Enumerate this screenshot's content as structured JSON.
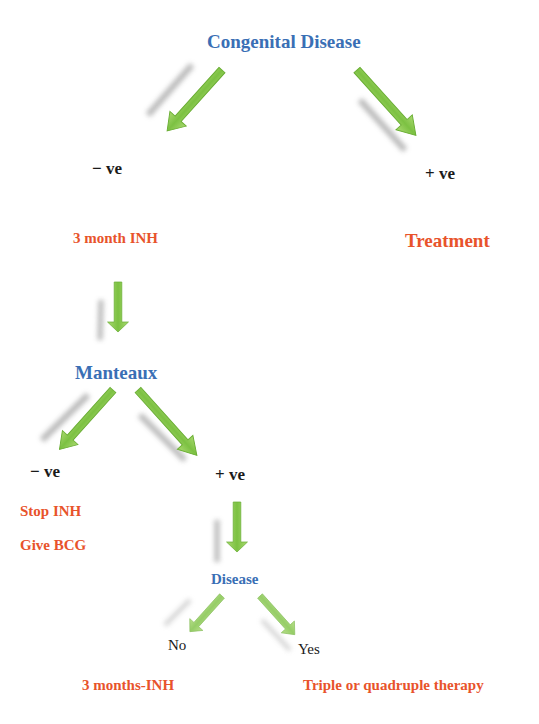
{
  "diagram": {
    "root": {
      "label": "Congenital Disease"
    },
    "root_negative": {
      "label": "− ve"
    },
    "root_positive": {
      "label": "+ ve"
    },
    "neg_action": {
      "label": "3 month INH"
    },
    "pos_action": {
      "label": "Treatment"
    },
    "test": {
      "label": "Manteaux"
    },
    "test_negative": {
      "label": "− ve"
    },
    "test_positive": {
      "label": "+ ve"
    },
    "neg_actions": [
      {
        "label": "Stop INH"
      },
      {
        "label": "Give BCG"
      }
    ],
    "disease": {
      "label": "Disease"
    },
    "disease_no": {
      "label": "No"
    },
    "disease_yes": {
      "label": "Yes"
    },
    "no_action": {
      "label": "3 months-INH"
    },
    "yes_action": {
      "label": "Triple or quadruple therapy"
    }
  },
  "colors": {
    "heading_blue": "#3a6fb5",
    "action_orange": "#e8532b",
    "text_black": "#1a1a1a",
    "arrow_green": "#7cc142",
    "arrow_shadow": "#9a9a9a"
  }
}
